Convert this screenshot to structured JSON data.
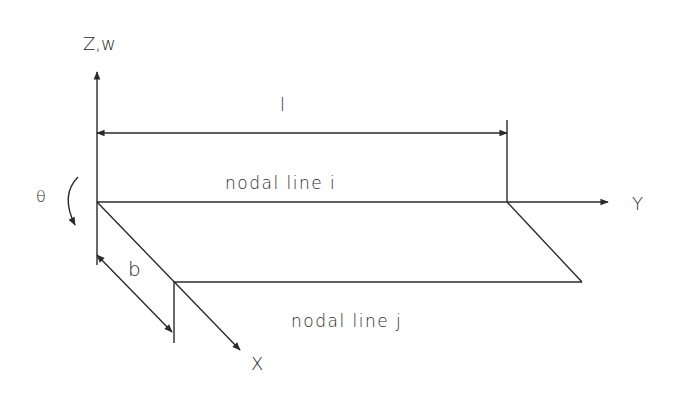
{
  "diagram": {
    "type": "finite-strip-geometry",
    "axes": {
      "z_label": "Z,w",
      "y_label": "Y",
      "x_label": "X"
    },
    "rotation_label": "θ",
    "dimensions": {
      "length_label": "l",
      "width_label": "b"
    },
    "nodal_lines": {
      "top": "nodal line i",
      "bottom": "nodal line j"
    },
    "colors": {
      "line": "#2a2a2a",
      "background": "#ffffff"
    }
  }
}
